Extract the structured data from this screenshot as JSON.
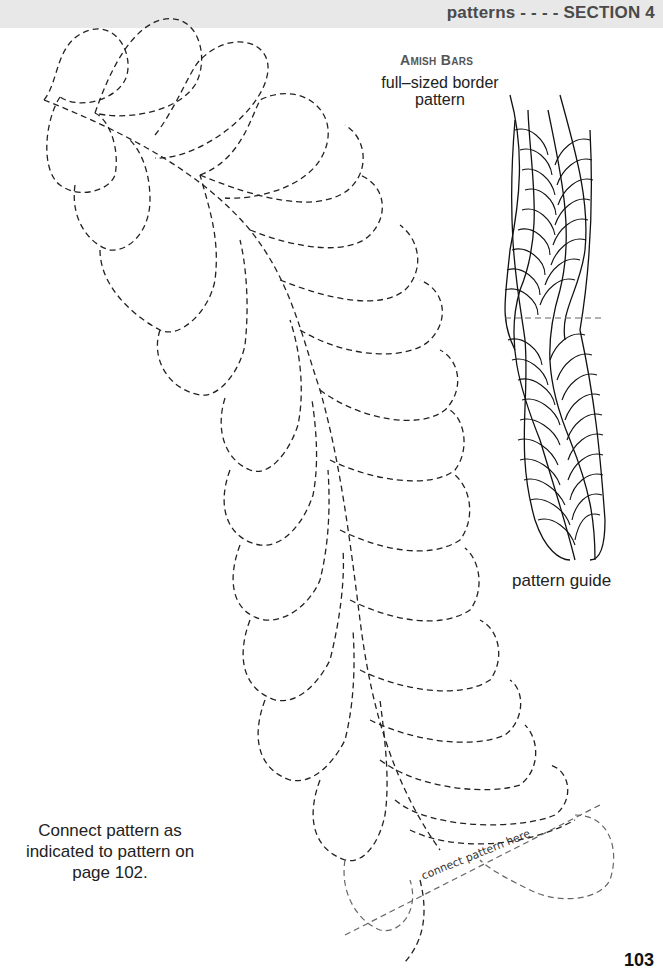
{
  "header": {
    "title": "patterns - - - - SECTION 4",
    "band_color": "#e8e8e8"
  },
  "pattern": {
    "title": "Amish Bars",
    "subtitle": "full–sized border pattern",
    "guide_label": "pattern guide",
    "connect_marker_label": "connect pattern here"
  },
  "note": {
    "text": "Connect pattern as indicated to pattern on page 102."
  },
  "footer": {
    "page_number_partial": "103"
  },
  "colors": {
    "line": "#222222",
    "connect_line": "#666666",
    "text": "#222222"
  },
  "icons": {
    "feather_pattern": "dashed-feather-quilting-pattern",
    "pattern_guide": "solid-feather-border-guide"
  }
}
